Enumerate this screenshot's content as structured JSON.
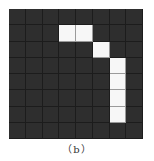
{
  "figure": {
    "caption": "（b）",
    "grid": {
      "rows": 8,
      "cols": 8,
      "background_color": "#2e2e2e",
      "active_color": "#f7f7f7",
      "active_cells": [
        [
          1,
          3
        ],
        [
          1,
          4
        ],
        [
          2,
          5
        ],
        [
          3,
          6
        ],
        [
          4,
          6
        ],
        [
          5,
          6
        ],
        [
          6,
          6
        ]
      ]
    }
  }
}
